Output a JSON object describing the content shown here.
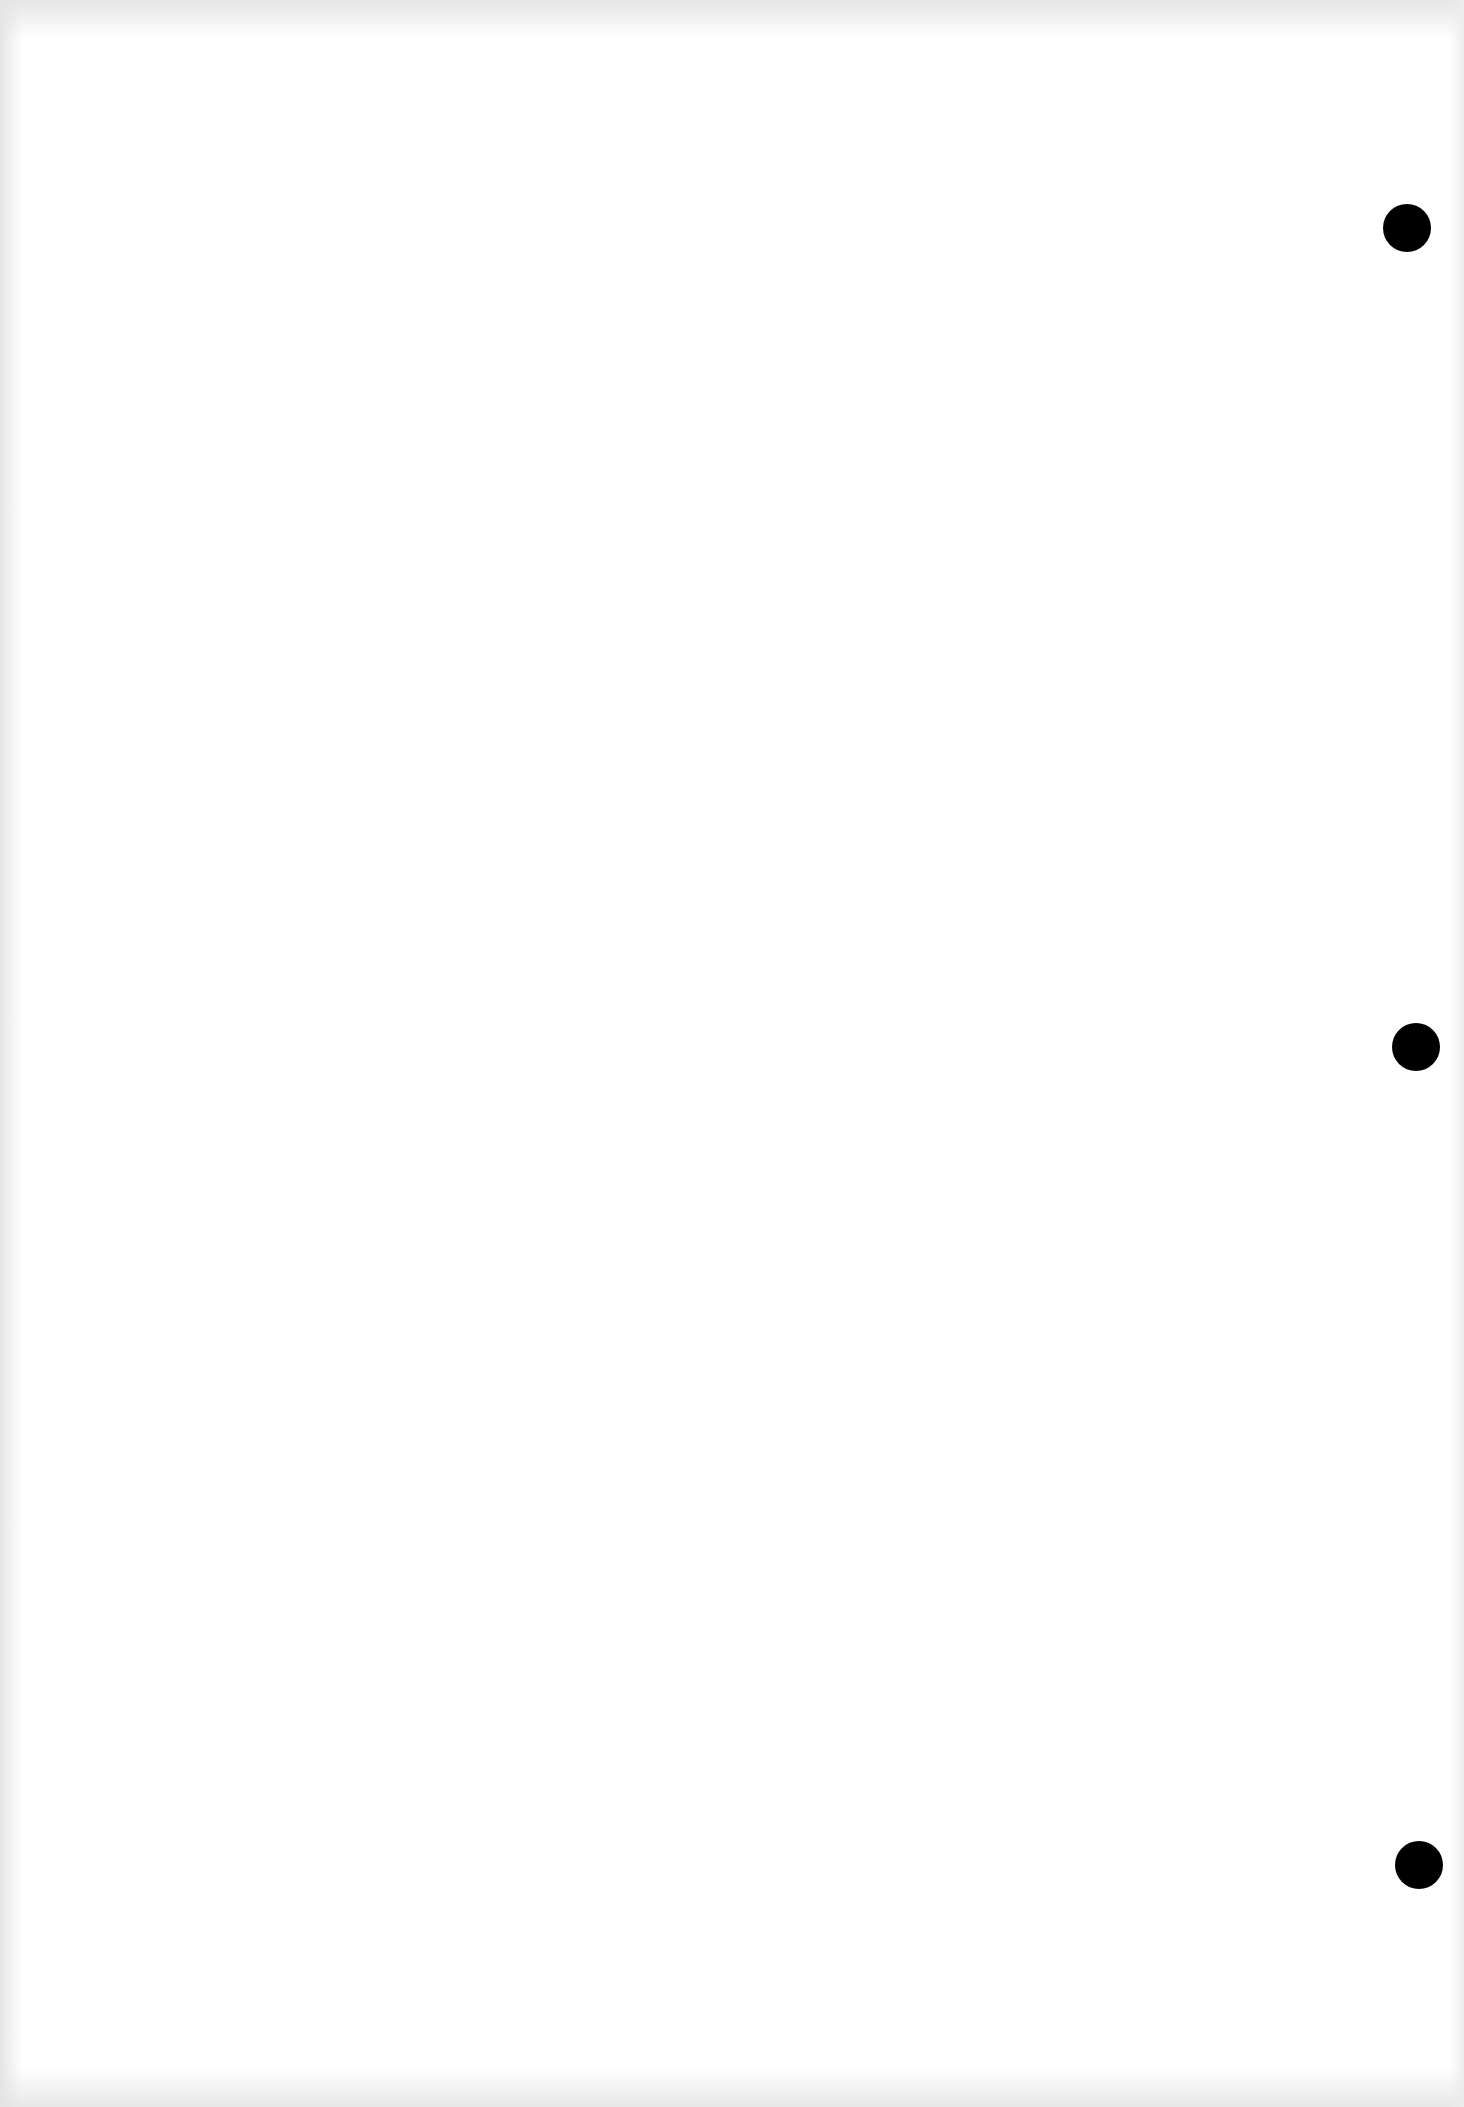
{
  "document": {
    "type": "blank scanned page",
    "text": "",
    "background_color": "#ffffff",
    "punch_holes": [
      {
        "x": 1383,
        "y": 204,
        "diameter": 48,
        "color": "#000000"
      },
      {
        "x": 1392,
        "y": 1023,
        "diameter": 48,
        "color": "#000000"
      },
      {
        "x": 1395,
        "y": 1841,
        "diameter": 48,
        "color": "#000000"
      }
    ]
  }
}
